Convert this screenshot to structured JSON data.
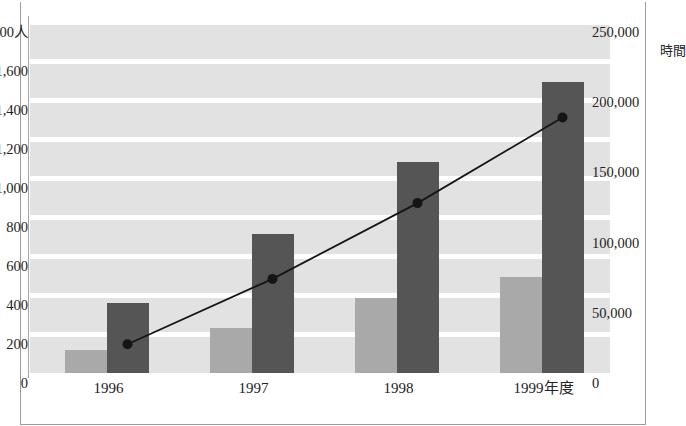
{
  "axes": {
    "left_unit": "人",
    "right_unit": "時間",
    "left_ticks": [
      "1,800人",
      "1,600",
      "1,400",
      "1,200",
      "1,000",
      "800",
      "600",
      "400",
      "200",
      "0"
    ],
    "right_ticks": [
      "250,000",
      "200,000",
      "150,000",
      "100,000",
      "50,000",
      "0"
    ],
    "x_labels": [
      "1996",
      "1997",
      "1998",
      "1999年度"
    ]
  },
  "colors": {
    "bar_light": "#a9a9a9",
    "bar_dark": "#555555",
    "plot_background": "#e2e2e2",
    "band": "#ffffff",
    "line": "#151515"
  },
  "chart_data": {
    "type": "bar",
    "title": "",
    "xlabel": "",
    "ylabel": "人",
    "y2label": "時間",
    "categories": [
      "1996",
      "1997",
      "1998",
      "1999年度"
    ],
    "ylim": [
      0,
      1800
    ],
    "y2lim": [
      0,
      250000
    ],
    "ytick_values": [
      0,
      200,
      400,
      600,
      800,
      1000,
      1200,
      1400,
      1600,
      1800
    ],
    "y2tick_values": [
      0,
      50000,
      100000,
      150000,
      200000,
      250000
    ],
    "grid": true,
    "legend_position": "none",
    "series": [
      {
        "name": "受講者数",
        "type": "bar",
        "axis": "left",
        "unit": "人",
        "color": "#a9a9a9",
        "values": [
          120,
          230,
          385,
          490
        ]
      },
      {
        "name": "研修時間",
        "type": "bar",
        "axis": "right",
        "unit": "時間",
        "color": "#555555",
        "values": [
          50000,
          99000,
          150000,
          207000
        ]
      },
      {
        "name": "推移",
        "type": "line",
        "axis": "right",
        "unit": "時間",
        "color": "#151515",
        "marker": "circle",
        "values": [
          20500,
          67000,
          121000,
          182000
        ]
      }
    ]
  }
}
